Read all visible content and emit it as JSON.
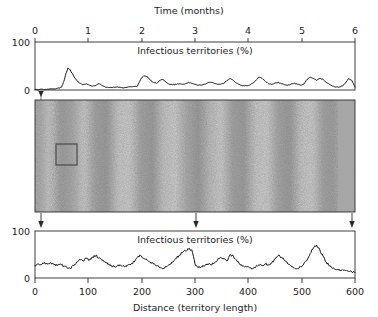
{
  "figure": {
    "top_axis_title": "Time (months)",
    "bottom_axis_title": "Distance (territory length)",
    "top_inner_label": "Infectious territories (%)",
    "bottom_inner_label": "Infectious territories (%)",
    "line_color": "#141414",
    "frame_color": "#2a2a2a",
    "panel_light": "#e8e8e8",
    "panel_dark": "#6f6f6f",
    "selection_box_color": "#4a4a4a"
  },
  "chart_data": [
    {
      "type": "line",
      "id": "time-series",
      "title": "Time (months)",
      "xlabel": "Time (months)",
      "ylabel": "Infectious territories (%)",
      "annotation": "Infectious territories (%)",
      "xlim": [
        0,
        6
      ],
      "ylim": [
        0,
        100
      ],
      "xticks": [
        0,
        1,
        2,
        3,
        4,
        5,
        6
      ],
      "xticklabels": [
        "0",
        "1",
        "2",
        "3",
        "4",
        "5",
        "6"
      ],
      "yticks": [
        0,
        100
      ],
      "yticklabels": [
        "0",
        "100"
      ],
      "grid": false,
      "legend": null,
      "x": [
        0.0,
        0.08,
        0.16,
        0.24,
        0.32,
        0.4,
        0.46,
        0.5,
        0.54,
        0.58,
        0.62,
        0.66,
        0.72,
        0.78,
        0.84,
        0.9,
        0.96,
        1.02,
        1.08,
        1.14,
        1.2,
        1.26,
        1.32,
        1.38,
        1.44,
        1.5,
        1.56,
        1.62,
        1.68,
        1.74,
        1.8,
        1.86,
        1.92,
        1.98,
        2.04,
        2.1,
        2.16,
        2.22,
        2.28,
        2.34,
        2.4,
        2.46,
        2.52,
        2.58,
        2.64,
        2.7,
        2.76,
        2.82,
        2.88,
        2.94,
        3.0,
        3.06,
        3.12,
        3.18,
        3.24,
        3.3,
        3.36,
        3.42,
        3.48,
        3.54,
        3.6,
        3.66,
        3.72,
        3.78,
        3.84,
        3.9,
        3.96,
        4.02,
        4.08,
        4.14,
        4.2,
        4.26,
        4.32,
        4.38,
        4.44,
        4.5,
        4.56,
        4.62,
        4.68,
        4.74,
        4.8,
        4.86,
        4.92,
        4.98,
        5.04,
        5.1,
        5.16,
        5.22,
        5.28,
        5.34,
        5.4,
        5.46,
        5.52,
        5.58,
        5.64,
        5.7,
        5.76,
        5.82,
        5.88,
        5.94,
        6.0
      ],
      "y": [
        1,
        1,
        1,
        2,
        2,
        3,
        4,
        6,
        18,
        34,
        46,
        42,
        30,
        20,
        14,
        11,
        13,
        10,
        8,
        9,
        14,
        9,
        6,
        5,
        5,
        6,
        6,
        5,
        5,
        6,
        7,
        7,
        8,
        22,
        30,
        28,
        21,
        16,
        14,
        20,
        22,
        16,
        12,
        11,
        12,
        13,
        12,
        13,
        16,
        14,
        12,
        10,
        10,
        12,
        15,
        16,
        14,
        12,
        12,
        14,
        20,
        24,
        20,
        14,
        11,
        9,
        9,
        10,
        14,
        20,
        27,
        24,
        18,
        13,
        12,
        14,
        16,
        13,
        11,
        10,
        12,
        14,
        12,
        10,
        12,
        22,
        27,
        24,
        20,
        24,
        22,
        16,
        12,
        8,
        6,
        6,
        8,
        14,
        24,
        20,
        6
      ]
    },
    {
      "type": "line",
      "id": "space-series",
      "title": "Distance (territory length)",
      "xlabel": "Distance (territory length)",
      "ylabel": "Infectious territories (%)",
      "annotation": "Infectious territories (%)",
      "xlim": [
        0,
        600
      ],
      "ylim": [
        0,
        100
      ],
      "xticks": [
        0,
        100,
        200,
        300,
        400,
        500,
        600
      ],
      "xticklabels": [
        "0",
        "100",
        "200",
        "300",
        "400",
        "500",
        "600"
      ],
      "yticks": [
        0,
        100
      ],
      "yticklabels": [
        "0",
        "100"
      ],
      "grid": false,
      "legend": null,
      "x": [
        0,
        6,
        12,
        18,
        24,
        30,
        36,
        42,
        48,
        54,
        60,
        66,
        72,
        78,
        84,
        90,
        96,
        102,
        108,
        114,
        120,
        126,
        132,
        138,
        144,
        150,
        156,
        162,
        168,
        174,
        180,
        186,
        192,
        198,
        204,
        210,
        216,
        222,
        228,
        234,
        240,
        246,
        252,
        258,
        264,
        270,
        276,
        282,
        288,
        294,
        300,
        306,
        312,
        318,
        324,
        330,
        336,
        342,
        348,
        354,
        360,
        366,
        372,
        378,
        384,
        390,
        396,
        402,
        408,
        414,
        420,
        426,
        432,
        438,
        444,
        450,
        456,
        462,
        468,
        474,
        480,
        486,
        492,
        498,
        504,
        510,
        516,
        522,
        528,
        534,
        540,
        546,
        552,
        558,
        564,
        570,
        576,
        582,
        588,
        594,
        600
      ],
      "y": [
        26,
        30,
        28,
        33,
        29,
        32,
        28,
        26,
        30,
        25,
        22,
        20,
        26,
        34,
        40,
        36,
        42,
        38,
        44,
        48,
        42,
        38,
        34,
        30,
        26,
        24,
        28,
        26,
        24,
        27,
        30,
        34,
        44,
        48,
        42,
        38,
        34,
        30,
        26,
        22,
        20,
        24,
        28,
        34,
        42,
        48,
        54,
        58,
        62,
        60,
        30,
        22,
        24,
        26,
        30,
        28,
        32,
        38,
        44,
        40,
        36,
        50,
        46,
        38,
        30,
        26,
        24,
        22,
        20,
        24,
        28,
        26,
        30,
        28,
        32,
        40,
        48,
        44,
        38,
        30,
        26,
        22,
        20,
        24,
        30,
        38,
        52,
        64,
        70,
        60,
        46,
        34,
        26,
        20,
        18,
        16,
        18,
        16,
        14,
        13,
        12
      ]
    }
  ],
  "panel": {
    "name": "spatiotemporal-raster",
    "selection_box": {
      "label": "region-of-interest"
    },
    "arrows": [
      {
        "label": "arrow-marker-left"
      },
      {
        "label": "arrow-marker-center"
      },
      {
        "label": "arrow-marker-right"
      }
    ],
    "top_marker": {
      "label": "time-point-marker"
    }
  }
}
